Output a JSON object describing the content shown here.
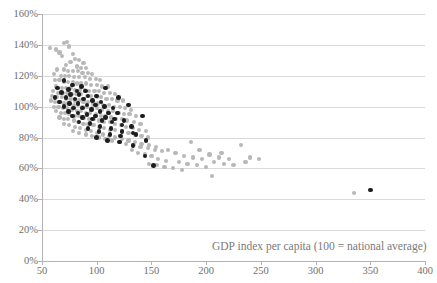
{
  "chart_data": {
    "type": "scatter",
    "title": "",
    "xlabel": "GDP index per capita (100 = national average)",
    "ylabel": "",
    "xlim": [
      50,
      400
    ],
    "ylim": [
      0,
      160
    ],
    "xticks": [
      50,
      100,
      150,
      200,
      250,
      300,
      350,
      400
    ],
    "xtick_labels": [
      "50",
      "100",
      "150",
      "200",
      "250",
      "300",
      "350",
      "400"
    ],
    "yticks": [
      0,
      20,
      40,
      60,
      80,
      100,
      120,
      140,
      160
    ],
    "ytick_labels": [
      "0%",
      "20%",
      "40%",
      "60%",
      "80%",
      "100%",
      "120%",
      "140%",
      "160%"
    ],
    "grid": "horizontal-only",
    "legend": "none",
    "colors": {
      "series_a": "#b7b7b7",
      "series_b": "#1d1d1d",
      "gridline": "#d9d9d9",
      "axis": "#b3b3b3",
      "text": "#6f6f6f"
    },
    "series": [
      {
        "name": "series_a",
        "color": "#b7b7b7",
        "marker": "circle",
        "points": [
          [
            57,
            138
          ],
          [
            63,
            137
          ],
          [
            70,
            141
          ],
          [
            73,
            142
          ],
          [
            75,
            139
          ],
          [
            66,
            135
          ],
          [
            78,
            134
          ],
          [
            68,
            133
          ],
          [
            80,
            131
          ],
          [
            84,
            130
          ],
          [
            76,
            129
          ],
          [
            88,
            128
          ],
          [
            72,
            127
          ],
          [
            82,
            126
          ],
          [
            86,
            125
          ],
          [
            90,
            125
          ],
          [
            64,
            124
          ],
          [
            70,
            124
          ],
          [
            74,
            123
          ],
          [
            78,
            123
          ],
          [
            83,
            123
          ],
          [
            87,
            122
          ],
          [
            92,
            122
          ],
          [
            96,
            121
          ],
          [
            61,
            121
          ],
          [
            67,
            120
          ],
          [
            71,
            120
          ],
          [
            75,
            120
          ],
          [
            79,
            119
          ],
          [
            84,
            119
          ],
          [
            89,
            119
          ],
          [
            94,
            118
          ],
          [
            99,
            118
          ],
          [
            103,
            117
          ],
          [
            62,
            117
          ],
          [
            66,
            117
          ],
          [
            70,
            116
          ],
          [
            74,
            116
          ],
          [
            78,
            116
          ],
          [
            82,
            115
          ],
          [
            86,
            115
          ],
          [
            90,
            115
          ],
          [
            95,
            114
          ],
          [
            100,
            114
          ],
          [
            105,
            113
          ],
          [
            110,
            113
          ],
          [
            63,
            113
          ],
          [
            68,
            112
          ],
          [
            72,
            112
          ],
          [
            76,
            112
          ],
          [
            80,
            111
          ],
          [
            85,
            111
          ],
          [
            89,
            111
          ],
          [
            93,
            110
          ],
          [
            98,
            110
          ],
          [
            102,
            110
          ],
          [
            107,
            109
          ],
          [
            112,
            109
          ],
          [
            117,
            108
          ],
          [
            60,
            110
          ],
          [
            65,
            109
          ],
          [
            69,
            109
          ],
          [
            73,
            109
          ],
          [
            77,
            108
          ],
          [
            81,
            108
          ],
          [
            86,
            108
          ],
          [
            91,
            107
          ],
          [
            95,
            107
          ],
          [
            100,
            106
          ],
          [
            104,
            106
          ],
          [
            109,
            105
          ],
          [
            114,
            105
          ],
          [
            119,
            104
          ],
          [
            124,
            104
          ],
          [
            59,
            107
          ],
          [
            64,
            106
          ],
          [
            68,
            106
          ],
          [
            72,
            105
          ],
          [
            76,
            105
          ],
          [
            80,
            104
          ],
          [
            84,
            104
          ],
          [
            88,
            103
          ],
          [
            92,
            103
          ],
          [
            97,
            102
          ],
          [
            101,
            102
          ],
          [
            106,
            101
          ],
          [
            111,
            101
          ],
          [
            116,
            100
          ],
          [
            121,
            100
          ],
          [
            126,
            99
          ],
          [
            131,
            98
          ],
          [
            58,
            104
          ],
          [
            62,
            103
          ],
          [
            66,
            103
          ],
          [
            70,
            102
          ],
          [
            74,
            102
          ],
          [
            79,
            101
          ],
          [
            83,
            101
          ],
          [
            87,
            100
          ],
          [
            91,
            100
          ],
          [
            96,
            99
          ],
          [
            100,
            99
          ],
          [
            105,
            98
          ],
          [
            110,
            97
          ],
          [
            115,
            97
          ],
          [
            120,
            96
          ],
          [
            125,
            95
          ],
          [
            130,
            95
          ],
          [
            136,
            94
          ],
          [
            61,
            100
          ],
          [
            65,
            100
          ],
          [
            69,
            99
          ],
          [
            73,
            99
          ],
          [
            77,
            98
          ],
          [
            82,
            97
          ],
          [
            86,
            97
          ],
          [
            90,
            96
          ],
          [
            94,
            96
          ],
          [
            99,
            95
          ],
          [
            104,
            94
          ],
          [
            108,
            94
          ],
          [
            113,
            93
          ],
          [
            118,
            92
          ],
          [
            123,
            92
          ],
          [
            128,
            91
          ],
          [
            134,
            90
          ],
          [
            140,
            89
          ],
          [
            63,
            97
          ],
          [
            67,
            96
          ],
          [
            71,
            96
          ],
          [
            75,
            95
          ],
          [
            80,
            94
          ],
          [
            84,
            94
          ],
          [
            88,
            93
          ],
          [
            93,
            92
          ],
          [
            97,
            92
          ],
          [
            102,
            91
          ],
          [
            107,
            90
          ],
          [
            112,
            90
          ],
          [
            117,
            89
          ],
          [
            122,
            88
          ],
          [
            127,
            87
          ],
          [
            133,
            86
          ],
          [
            139,
            85
          ],
          [
            145,
            84
          ],
          [
            66,
            93
          ],
          [
            70,
            92
          ],
          [
            74,
            92
          ],
          [
            79,
            91
          ],
          [
            83,
            90
          ],
          [
            88,
            89
          ],
          [
            92,
            89
          ],
          [
            97,
            88
          ],
          [
            102,
            87
          ],
          [
            107,
            86
          ],
          [
            112,
            85
          ],
          [
            117,
            85
          ],
          [
            123,
            84
          ],
          [
            129,
            83
          ],
          [
            135,
            82
          ],
          [
            141,
            81
          ],
          [
            147,
            80
          ],
          [
            70,
            89
          ],
          [
            75,
            88
          ],
          [
            80,
            87
          ],
          [
            85,
            86
          ],
          [
            90,
            85
          ],
          [
            95,
            84
          ],
          [
            100,
            83
          ],
          [
            106,
            82
          ],
          [
            111,
            81
          ],
          [
            117,
            80
          ],
          [
            123,
            79
          ],
          [
            129,
            78
          ],
          [
            135,
            77
          ],
          [
            141,
            76
          ],
          [
            148,
            75
          ],
          [
            154,
            74
          ],
          [
            78,
            84
          ],
          [
            84,
            83
          ],
          [
            90,
            82
          ],
          [
            96,
            81
          ],
          [
            102,
            80
          ],
          [
            108,
            79
          ],
          [
            114,
            78
          ],
          [
            121,
            77
          ],
          [
            127,
            76
          ],
          [
            134,
            75
          ],
          [
            140,
            74
          ],
          [
            147,
            73
          ],
          [
            153,
            72
          ],
          [
            160,
            71
          ],
          [
            132,
            72
          ],
          [
            138,
            70
          ],
          [
            144,
            69
          ],
          [
            150,
            68
          ],
          [
            156,
            66
          ],
          [
            163,
            65
          ],
          [
            148,
            63
          ],
          [
            155,
            62
          ],
          [
            162,
            61
          ],
          [
            170,
            60
          ],
          [
            178,
            59
          ],
          [
            165,
            72
          ],
          [
            172,
            70
          ],
          [
            180,
            68
          ],
          [
            188,
            67
          ],
          [
            196,
            66
          ],
          [
            175,
            64
          ],
          [
            183,
            63
          ],
          [
            192,
            62
          ],
          [
            200,
            61
          ],
          [
            186,
            77
          ],
          [
            194,
            72
          ],
          [
            203,
            69
          ],
          [
            212,
            67
          ],
          [
            221,
            66
          ],
          [
            207,
            64
          ],
          [
            216,
            63
          ],
          [
            225,
            62
          ],
          [
            205,
            55
          ],
          [
            214,
            70
          ],
          [
            232,
            75
          ],
          [
            240,
            67
          ],
          [
            248,
            66
          ],
          [
            236,
            64
          ],
          [
            335,
            44
          ]
        ]
      },
      {
        "name": "series_b",
        "color": "#1d1d1d",
        "marker": "circle",
        "points": [
          [
            70,
            117
          ],
          [
            78,
            114
          ],
          [
            86,
            113
          ],
          [
            64,
            112
          ],
          [
            74,
            111
          ],
          [
            82,
            110
          ],
          [
            90,
            110
          ],
          [
            68,
            109
          ],
          [
            76,
            108
          ],
          [
            84,
            108
          ],
          [
            92,
            107
          ],
          [
            100,
            107
          ],
          [
            62,
            106
          ],
          [
            72,
            106
          ],
          [
            80,
            105
          ],
          [
            88,
            105
          ],
          [
            96,
            104
          ],
          [
            104,
            103
          ],
          [
            66,
            103
          ],
          [
            75,
            102
          ],
          [
            83,
            102
          ],
          [
            91,
            101
          ],
          [
            99,
            101
          ],
          [
            107,
            100
          ],
          [
            115,
            99
          ],
          [
            70,
            100
          ],
          [
            79,
            99
          ],
          [
            87,
            99
          ],
          [
            95,
            98
          ],
          [
            103,
            97
          ],
          [
            111,
            96
          ],
          [
            119,
            96
          ],
          [
            74,
            97
          ],
          [
            83,
            96
          ],
          [
            91,
            95
          ],
          [
            99,
            94
          ],
          [
            108,
            93
          ],
          [
            116,
            92
          ],
          [
            125,
            91
          ],
          [
            78,
            94
          ],
          [
            87,
            93
          ],
          [
            96,
            92
          ],
          [
            105,
            91
          ],
          [
            114,
            90
          ],
          [
            123,
            88
          ],
          [
            132,
            87
          ],
          [
            84,
            90
          ],
          [
            94,
            89
          ],
          [
            103,
            87
          ],
          [
            113,
            86
          ],
          [
            123,
            84
          ],
          [
            133,
            83
          ],
          [
            92,
            86
          ],
          [
            102,
            84
          ],
          [
            112,
            82
          ],
          [
            122,
            81
          ],
          [
            100,
            80
          ],
          [
            110,
            78
          ],
          [
            121,
            77
          ],
          [
            133,
            75
          ],
          [
            108,
            112
          ],
          [
            120,
            106
          ],
          [
            129,
            101
          ],
          [
            142,
            94
          ],
          [
            136,
            82
          ],
          [
            145,
            78
          ],
          [
            144,
            68
          ],
          [
            152,
            62
          ],
          [
            350,
            46
          ]
        ]
      }
    ]
  },
  "axes": {
    "x_title": "GDP index per capita (100 = national average)"
  }
}
